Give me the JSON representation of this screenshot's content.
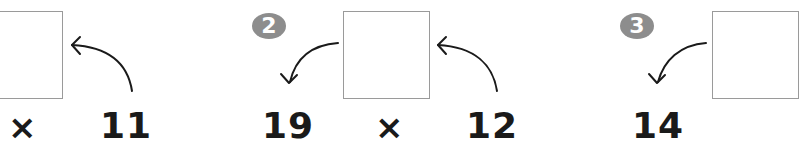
{
  "problems": [
    {
      "badge": "",
      "left": "",
      "op": "×",
      "right": "11"
    },
    {
      "badge": "2",
      "left": "19",
      "op": "×",
      "right": "12"
    },
    {
      "badge": "3",
      "left": "14",
      "op": "",
      "right": ""
    }
  ],
  "colors": {
    "badge_bg": "#8d8d8d",
    "box_border": "#9a9a9a",
    "text": "#1a1a1a"
  }
}
